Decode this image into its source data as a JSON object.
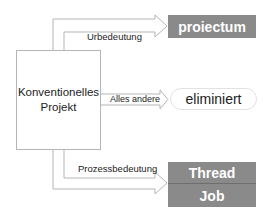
{
  "diagram": {
    "source": {
      "line1": "Konventionelles",
      "line2": "Projekt"
    },
    "edges": [
      {
        "label": "Urbedeutung",
        "target": "proiectum"
      },
      {
        "label": "Alles andere",
        "target": "eliminiert"
      },
      {
        "label": "Prozessbedeutung",
        "target": "Thread / Job"
      }
    ],
    "targets": {
      "top": "proiectum",
      "middle": "eliminiert",
      "bottom_upper": "Thread",
      "bottom_lower": "Job"
    },
    "colors": {
      "target_fill": "#8a8a8a",
      "target_text": "#ffffff",
      "arrow_stroke": "#b5b5b5"
    }
  }
}
